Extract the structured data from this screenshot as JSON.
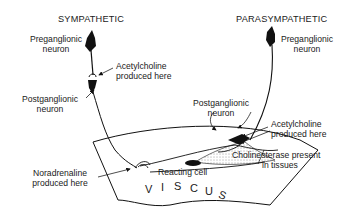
{
  "diagram": {
    "type": "autonomic-nervous-system-illustration",
    "sides": {
      "sympathetic": {
        "title": "SYMPATHETIC",
        "preganglionic": [
          "Preganglionic",
          "neuron"
        ],
        "synapse_label": [
          "Acetylcholine",
          "produced here"
        ],
        "postganglionic": [
          "Postganglionic",
          "neuron"
        ],
        "terminal_label": [
          "Noradrenaline",
          "produced here"
        ]
      },
      "parasympathetic": {
        "title": "PARASYMPATHETIC",
        "preganglionic": [
          "Preganglionic",
          "neuron"
        ],
        "postganglionic": [
          "Postganglionic",
          "neuron"
        ],
        "terminal_label": [
          "Acetylcholine",
          "produced here"
        ],
        "tissue_label": [
          "Cholinesterase present",
          "in tissues"
        ]
      }
    },
    "organ": {
      "reacting_cell": "Reacting cell",
      "viscus_letters": [
        "V",
        "I",
        "S",
        "C",
        "U",
        "S"
      ]
    },
    "colors": {
      "ink": "#111111",
      "background": "#ffffff"
    }
  }
}
